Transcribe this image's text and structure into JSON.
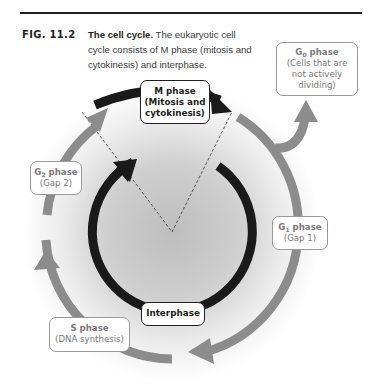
{
  "figure": {
    "label": "FIG. 11.2",
    "caption_title": "The cell cycle.",
    "caption_body": " The eukaryotic cell cycle consists of M phase (mitosis and cytokinesis) and interphase."
  },
  "phases": {
    "m": {
      "title": "M phase",
      "line1": "(Mitosis and",
      "line2": "cytokinesis)"
    },
    "g0": {
      "title_main": "G",
      "title_sub": "0",
      "title_rest": " phase",
      "line1": "(Cells that are",
      "line2": "not actively",
      "line3": "dividing)"
    },
    "g1": {
      "title_main": "G",
      "title_sub": "1",
      "title_rest": " phase",
      "line1": "(Gap 1)"
    },
    "g2": {
      "title_main": "G",
      "title_sub": "2",
      "title_rest": " phase",
      "line1": "(Gap 2)"
    },
    "s": {
      "title": "S phase",
      "line1": "(DNA synthesis)"
    },
    "interphase": {
      "label": "Interphase"
    }
  },
  "colors": {
    "outer_ring": "#8c8c8c",
    "inner_ring": "#1a1a1a",
    "text_dark": "#231f20",
    "text_gray": "#7a7a7a"
  }
}
